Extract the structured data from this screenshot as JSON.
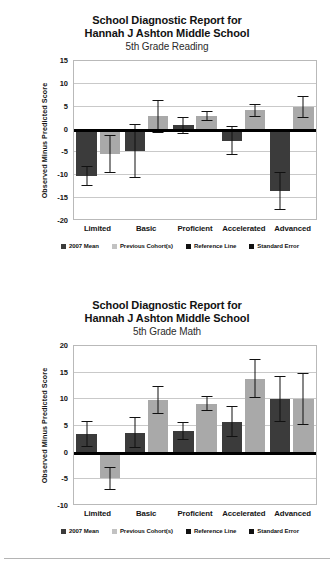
{
  "reports": [
    {
      "title_line1": "School Diagnostic Report for",
      "title_line2": "Hannah J Ashton Middle School",
      "title_line3": "5th Grade Reading",
      "ylabel": "Observed Minus Predicted Score",
      "yticks": [
        "15",
        "10",
        "5",
        "0",
        "-5",
        "-10",
        "-15",
        "-20"
      ],
      "categories": [
        "Limited",
        "Basic",
        "Proficient",
        "Accelerated",
        "Advanced"
      ],
      "legend": [
        {
          "label": "2007 Mean",
          "color": "#3b3b3b"
        },
        {
          "label": "Previous Cohort(s)",
          "color": "#c2c2c2"
        },
        {
          "label": "Reference Line",
          "color": "#111111"
        },
        {
          "label": "Standard Error",
          "color": "#111111"
        }
      ]
    },
    {
      "title_line1": "School Diagnostic Report for",
      "title_line2": "Hannah J Ashton Middle School",
      "title_line3": "5th Grade Math",
      "ylabel": "Observed Minus Predicted Score",
      "yticks": [
        "20",
        "15",
        "10",
        "5",
        "0",
        "-5",
        "-10"
      ],
      "categories": [
        "Limited",
        "Basic",
        "Proficient",
        "Accelerated",
        "Advanced"
      ],
      "legend": [
        {
          "label": "2007 Mean",
          "color": "#3b3b3b"
        },
        {
          "label": "Previous Cohort(s)",
          "color": "#c2c2c2"
        },
        {
          "label": "Reference Line",
          "color": "#111111"
        },
        {
          "label": "Standard Error",
          "color": "#111111"
        }
      ]
    }
  ],
  "chart_data": [
    {
      "type": "bar",
      "title": "School Diagnostic Report for Hannah J Ashton Middle School - 5th Grade Reading",
      "xlabel": "",
      "ylabel": "Observed Minus Predicted Score",
      "ylim": [
        -20,
        15
      ],
      "ytick_step": 5,
      "grid": true,
      "legend_position": "bottom",
      "reference_line": 0,
      "categories": [
        "Limited",
        "Basic",
        "Proficient",
        "Accelerated",
        "Advanced"
      ],
      "series": [
        {
          "name": "2007 Mean",
          "color": "#3b3b3b",
          "values": [
            -10.2,
            -4.7,
            0.9,
            -2.4,
            -13.4
          ],
          "error": [
            2.2,
            5.9,
            1.8,
            3.1,
            4.2
          ]
        },
        {
          "name": "Previous Cohort(s)",
          "color": "#a9a9a9",
          "values": [
            -5.4,
            2.9,
            3.0,
            4.2,
            5.0
          ],
          "error": [
            4.2,
            3.6,
            1.1,
            1.4,
            2.4
          ]
        }
      ]
    },
    {
      "type": "bar",
      "title": "School Diagnostic Report for Hannah J Ashton Middle School - 5th Grade Math",
      "xlabel": "",
      "ylabel": "Observed Minus Predicted Score",
      "ylim": [
        -10,
        20
      ],
      "ytick_step": 5,
      "grid": true,
      "legend_position": "bottom",
      "reference_line": 0,
      "categories": [
        "Limited",
        "Basic",
        "Proficient",
        "Accelerated",
        "Advanced"
      ],
      "series": [
        {
          "name": "2007 Mean",
          "color": "#3b3b3b",
          "values": [
            3.5,
            3.7,
            4.0,
            5.8,
            10.1
          ],
          "error": [
            2.4,
            2.9,
            1.7,
            2.9,
            4.3
          ]
        },
        {
          "name": "Previous Cohort(s)",
          "color": "#a9a9a9",
          "values": [
            -4.8,
            9.9,
            9.2,
            13.9,
            10.1
          ],
          "error": [
            2.2,
            2.6,
            1.4,
            3.6,
            4.9
          ]
        }
      ]
    }
  ]
}
